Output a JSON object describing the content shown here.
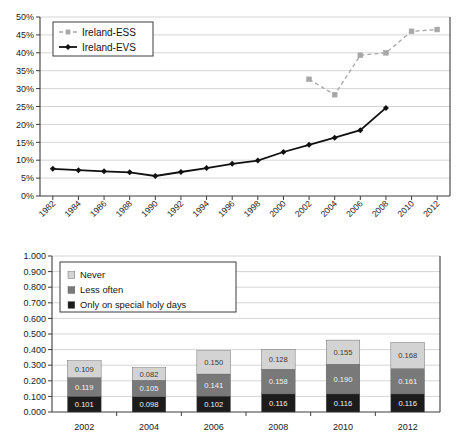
{
  "chart_data": [
    {
      "type": "line",
      "title": "",
      "xlabel": "",
      "ylabel": "",
      "ylim": [
        0,
        0.5
      ],
      "ytick_labels": [
        "0%",
        "5%",
        "10%",
        "15%",
        "20%",
        "25%",
        "30%",
        "35%",
        "40%",
        "45%",
        "50%"
      ],
      "ytick_values": [
        0,
        5,
        10,
        15,
        20,
        25,
        30,
        35,
        40,
        45,
        50
      ],
      "categories": [
        "1982",
        "1984",
        "1986",
        "1988",
        "1990",
        "1992",
        "1994",
        "1996",
        "1998",
        "2000",
        "2002",
        "2004",
        "2006",
        "2008",
        "2010",
        "2012"
      ],
      "grid": true,
      "legend_position": "top-left",
      "series": [
        {
          "name": "Ireland-ESS",
          "color": "#a8a8a8",
          "style": "dashed",
          "marker": "square",
          "values": [
            null,
            null,
            null,
            null,
            null,
            null,
            null,
            null,
            null,
            null,
            32.6,
            28.3,
            39.3,
            40.0,
            46.0,
            46.5
          ]
        },
        {
          "name": "Ireland-EVS",
          "color": "#111111",
          "style": "solid",
          "marker": "diamond",
          "values": [
            7.6,
            7.2,
            6.9,
            6.6,
            5.6,
            6.7,
            7.8,
            9.0,
            9.9,
            12.3,
            14.3,
            16.3,
            18.4,
            24.6,
            null,
            null
          ]
        }
      ]
    },
    {
      "type": "bar",
      "stacked": true,
      "title": "",
      "xlabel": "",
      "ylabel": "",
      "ylim": [
        0,
        1.0
      ],
      "ytick_labels": [
        "0.000",
        "0.100",
        "0.200",
        "0.300",
        "0.400",
        "0.500",
        "0.600",
        "0.700",
        "0.800",
        "0.900",
        "1.000"
      ],
      "ytick_values": [
        0,
        0.1,
        0.2,
        0.3,
        0.4,
        0.5,
        0.6,
        0.7,
        0.8,
        0.9,
        1.0
      ],
      "categories": [
        "2002",
        "2004",
        "2006",
        "2008",
        "2010",
        "2012"
      ],
      "grid": true,
      "legend_position": "top-left",
      "series": [
        {
          "name": "Only on special holy days",
          "color": "#1c1c1c",
          "values": [
            0.101,
            0.098,
            0.102,
            0.116,
            0.116,
            0.116
          ],
          "labels": [
            "0.101",
            "0.098",
            "0.102",
            "0.116",
            "0.116",
            "0.116"
          ]
        },
        {
          "name": "Less often",
          "color": "#797979",
          "values": [
            0.119,
            0.105,
            0.141,
            0.158,
            0.19,
            0.161
          ],
          "labels": [
            "0.119",
            "0.105",
            "0.141",
            "0.158",
            "0.190",
            "0.161"
          ]
        },
        {
          "name": "Never",
          "color": "#d3d3d3",
          "values": [
            0.109,
            0.082,
            0.15,
            0.128,
            0.155,
            0.168
          ],
          "labels": [
            "0.109",
            "0.082",
            "0.150",
            "0.128",
            "0.155",
            "0.168"
          ]
        }
      ]
    }
  ],
  "top_chart": {
    "legend": {
      "items": [
        {
          "label": "Ireland-ESS"
        },
        {
          "label": "Ireland-EVS"
        }
      ]
    }
  },
  "bottom_chart": {
    "legend": {
      "items": [
        {
          "label": "Never"
        },
        {
          "label": "Less often"
        },
        {
          "label": "Only on special holy days"
        }
      ]
    }
  }
}
